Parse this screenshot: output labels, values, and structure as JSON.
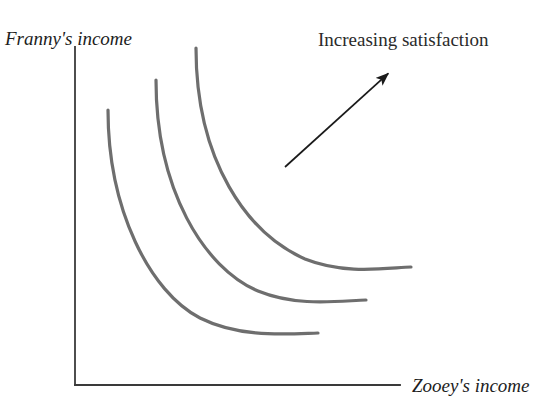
{
  "figure": {
    "background_color": "#ffffff"
  },
  "axes": {
    "y_label": "Franny's income",
    "x_label": "Zooey's income",
    "axis_color": "#3a3a3a",
    "origin": {
      "x": 75,
      "y": 385
    },
    "y_axis_top": {
      "x": 75,
      "y": 47
    },
    "x_axis_right": {
      "x": 400,
      "y": 385
    }
  },
  "annotation": {
    "text": "Increasing satisfaction",
    "text_position": {
      "x": 318,
      "y": 46
    },
    "arrow_color": "#1a1a1a",
    "arrow_start": {
      "x": 285,
      "y": 167
    },
    "arrow_end": {
      "x": 392,
      "y": 70
    }
  },
  "chart_data": {
    "type": "line",
    "title": "",
    "xlabel": "Zooey's income",
    "ylabel": "Franny's income",
    "grid": false,
    "legend": "none",
    "axis_ticks": [],
    "curve_color": "#6e6e6e",
    "curve_width": 3.2,
    "note": "Three convex-to-origin indifference curves; utility increases moving up and to the right.",
    "series": [
      {
        "name": "indifference-curve-low",
        "utility_rank": 1,
        "path": "M 108 110 C 108 210, 150 292, 200 318 C 240 338, 285 334, 318 333",
        "start_point": {
          "x": 108,
          "y": 110
        },
        "end_point": {
          "x": 318,
          "y": 333
        }
      },
      {
        "name": "indifference-curve-middle",
        "utility_rank": 2,
        "path": "M 156 80 C 156 190, 204 268, 258 291 C 297 307, 338 301, 366 300",
        "start_point": {
          "x": 156,
          "y": 80
        },
        "end_point": {
          "x": 366,
          "y": 300
        }
      },
      {
        "name": "indifference-curve-high",
        "utility_rank": 3,
        "path": "M 196 48 C 196 162, 248 234, 305 259 C 345 275, 386 268, 411 267",
        "start_point": {
          "x": 196,
          "y": 48
        },
        "end_point": {
          "x": 411,
          "y": 267
        }
      }
    ]
  }
}
